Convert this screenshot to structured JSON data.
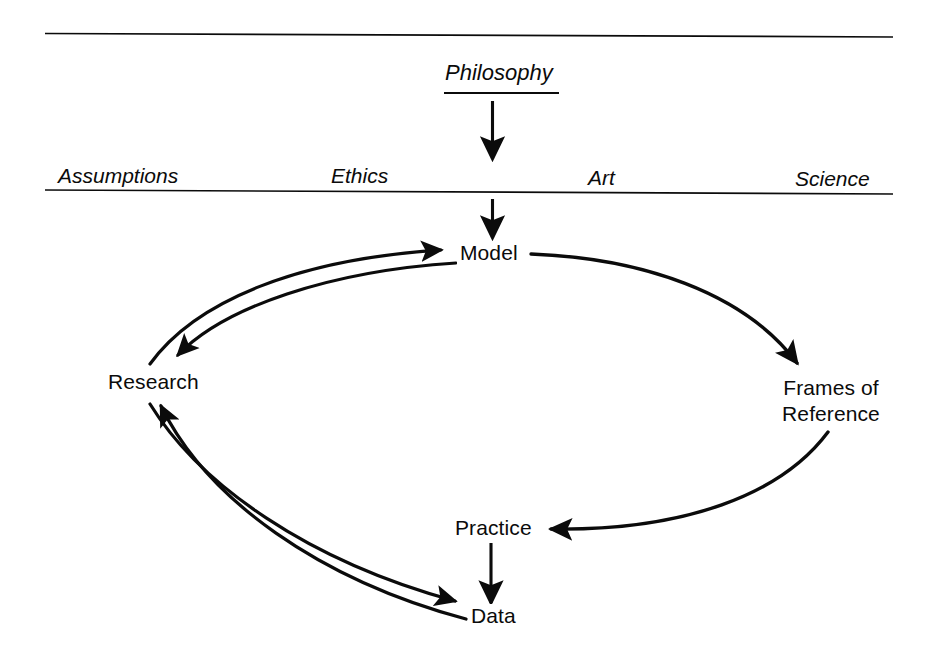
{
  "figure": {
    "type": "diagram",
    "subtype": "cyclic-flow-diagram",
    "background_color": "#ffffff",
    "ink_color": "#0b0b0b"
  },
  "source": {
    "label": "Philosophy",
    "underlined": true
  },
  "band": {
    "labels": [
      {
        "id": "assumptions",
        "text": "Assumptions"
      },
      {
        "id": "ethics",
        "text": "Ethics"
      },
      {
        "id": "art",
        "text": "Art"
      },
      {
        "id": "science",
        "text": "Science"
      }
    ]
  },
  "nodes": [
    {
      "id": "model",
      "label": "Model",
      "lines": [
        "Model"
      ]
    },
    {
      "id": "research",
      "label": "Research",
      "lines": [
        "Research"
      ]
    },
    {
      "id": "frames",
      "label": "Frames of Reference",
      "lines": [
        "Frames of",
        "Reference"
      ]
    },
    {
      "id": "practice",
      "label": "Practice",
      "lines": [
        "Practice"
      ]
    },
    {
      "id": "data",
      "label": "Data",
      "lines": [
        "Data"
      ]
    }
  ],
  "edges": [
    {
      "id": "philosophy-to-band",
      "from": "Philosophy",
      "to": "band",
      "style": "straight-arrow"
    },
    {
      "id": "band-to-model",
      "from": "band",
      "to": "Model",
      "style": "straight-arrow"
    },
    {
      "id": "model-to-frames",
      "from": "Model",
      "to": "Frames of Reference",
      "style": "curved-arrow"
    },
    {
      "id": "frames-to-practice",
      "from": "Frames of Reference",
      "to": "Practice",
      "style": "curved-arrow"
    },
    {
      "id": "practice-to-data",
      "from": "Practice",
      "to": "Data",
      "style": "straight-arrow"
    },
    {
      "id": "data-to-research",
      "from": "Data",
      "to": "Research",
      "style": "curved-arrow"
    },
    {
      "id": "research-to-model",
      "from": "Research",
      "to": "Model",
      "style": "curved-arrow"
    },
    {
      "id": "model-to-research",
      "from": "Model",
      "to": "Research",
      "style": "curved-arrow"
    },
    {
      "id": "research-to-data",
      "from": "Research",
      "to": "Data",
      "style": "curved-arrow"
    }
  ],
  "rules": [
    {
      "id": "top-rule",
      "orientation": "horizontal"
    },
    {
      "id": "band-rule",
      "orientation": "horizontal"
    }
  ]
}
